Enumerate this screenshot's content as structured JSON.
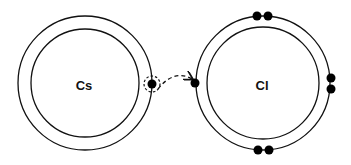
{
  "diagram": {
    "atoms": [
      {
        "symbol": "Cs",
        "cx": 85,
        "cy": 83,
        "outer_r": 67,
        "inner_r": 54,
        "valence_electrons": 1
      },
      {
        "symbol": "Cl",
        "cx": 263,
        "cy": 83,
        "outer_r": 67,
        "inner_r": 56,
        "valence_electrons": 7
      }
    ],
    "transfer": {
      "from": "Cs",
      "to": "Cl",
      "style": "dashed-arrow"
    },
    "colors": {
      "stroke": "#111111",
      "electron": "#000000",
      "background": "#ffffff"
    }
  }
}
